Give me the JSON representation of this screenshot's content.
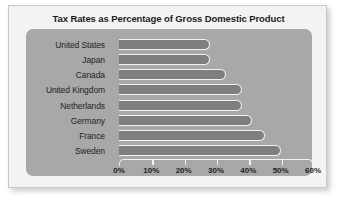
{
  "chart_data": {
    "type": "bar",
    "orientation": "horizontal",
    "title": "Tax Rates as Percentage of Gross Domestic Product",
    "xlabel": "",
    "ylabel": "",
    "categories": [
      "United States",
      "Japan",
      "Canada",
      "United Kingdom",
      "Netherlands",
      "Germany",
      "France",
      "Sweden"
    ],
    "values": [
      28,
      28,
      33,
      38,
      38,
      41,
      45,
      50
    ],
    "xlim": [
      0,
      60
    ],
    "xticks": [
      0,
      10,
      20,
      30,
      40,
      50,
      60
    ],
    "xtick_labels": [
      "0%",
      "10%",
      "20%",
      "30%",
      "40%",
      "50%",
      "60%"
    ],
    "grid": false,
    "legend": false,
    "colors": {
      "bar_fill": "#7e7e7e",
      "bar_outline": "#f2f2f2",
      "plot_background": "#a8a8a8",
      "card_background": "#f3f3f3",
      "text": "#1f1f1f"
    }
  }
}
